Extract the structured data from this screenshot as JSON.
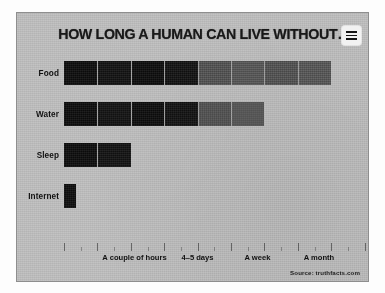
{
  "panel": {
    "background_color": "#c3c3c3",
    "border_color": "#8e8e8e"
  },
  "header": {
    "title": "HOW LONG A HUMAN CAN LIVE WITHOUT…",
    "menu_icon": "hamburger-menu-icon"
  },
  "footer": {
    "source": "Source: truthfacts.com"
  },
  "colors": {
    "dark_segment": "#0c0c0c",
    "gray_segment": "#555555",
    "text": "#111111",
    "tick": "#7a7a7a"
  },
  "chart_data": {
    "type": "bar",
    "orientation": "horizontal",
    "title": "HOW LONG A HUMAN CAN LIVE WITHOUT…",
    "xlabel": "",
    "ylabel": "",
    "grid": false,
    "legend": "none",
    "categories": [
      "Food",
      "Water",
      "Sleep",
      "Internet"
    ],
    "unit": "segments",
    "segment_count_total": 9,
    "values": [
      8,
      6,
      2,
      0.35
    ],
    "series": [
      {
        "name": "Survival time",
        "values": [
          8,
          6,
          2,
          0.35
        ]
      }
    ],
    "bars": [
      {
        "category": "Food",
        "value": 8,
        "segments": [
          {
            "shade": "dark"
          },
          {
            "shade": "dark"
          },
          {
            "shade": "dark"
          },
          {
            "shade": "dark"
          },
          {
            "shade": "gray"
          },
          {
            "shade": "gray"
          },
          {
            "shade": "gray"
          },
          {
            "shade": "gray"
          }
        ]
      },
      {
        "category": "Water",
        "value": 6,
        "segments": [
          {
            "shade": "dark"
          },
          {
            "shade": "dark"
          },
          {
            "shade": "dark"
          },
          {
            "shade": "dark"
          },
          {
            "shade": "gray"
          },
          {
            "shade": "gray"
          }
        ]
      },
      {
        "category": "Sleep",
        "value": 2,
        "segments": [
          {
            "shade": "dark"
          },
          {
            "shade": "dark"
          }
        ]
      },
      {
        "category": "Internet",
        "value": 0.35,
        "segments": [
          {
            "shade": "dark"
          }
        ]
      }
    ],
    "xtick_labels": [
      "A couple of hours",
      "4–5 days",
      "A week",
      "A month"
    ],
    "xtick_positions_pct": [
      23.5,
      44.5,
      64.5,
      85.0
    ],
    "xlim": [
      0,
      9
    ]
  }
}
